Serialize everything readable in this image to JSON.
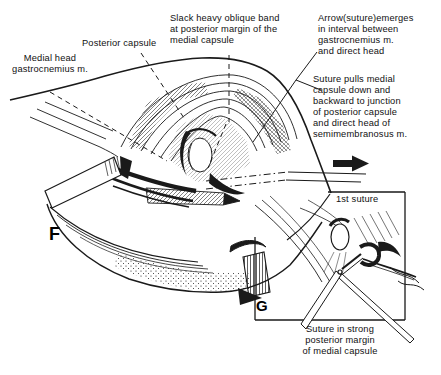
{
  "figure": {
    "type": "surgical-anatomy-illustration",
    "colors": {
      "ink": "#1a1a1a",
      "background": "#ffffff"
    },
    "panels": {
      "f_letter": "F",
      "g_letter": "G"
    },
    "labels": {
      "medial_head": {
        "lines": [
          "Medial head",
          "gastrocnemius m."
        ]
      },
      "posterior_capsule": {
        "text": "Posterior capsule"
      },
      "slack_band": {
        "lines": [
          "Slack heavy oblique band",
          "at posterior margin of the",
          "medial capsule"
        ]
      },
      "arrow_suture": {
        "lines": [
          "Arrow(suture)emerges",
          "in interval between",
          "gastrocnemius m.",
          "and direct head"
        ]
      },
      "suture_pulls": {
        "lines": [
          "Suture pulls medial",
          "capsule down and",
          "backward to junction",
          "of posterior capsule",
          "and direct head of",
          "semimembranosus m."
        ]
      },
      "first_suture": {
        "text": "1st suture"
      },
      "inset_caption": {
        "lines": [
          "Suture in strong",
          "posterior margin",
          "of medial capsule"
        ]
      }
    }
  }
}
